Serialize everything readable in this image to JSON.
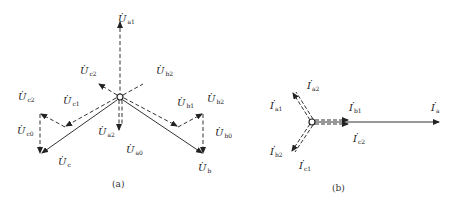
{
  "diagram_a": {
    "caption": "(a)",
    "labels": {
      "Ua1": {
        "sym": "U",
        "sub": "a1"
      },
      "Ua2": {
        "sym": "U",
        "sub": "a2"
      },
      "Ua0": {
        "sym": "U",
        "sub": "a0"
      },
      "Ub": {
        "sym": "U",
        "sub": "b"
      },
      "Ub1": {
        "sym": "U",
        "sub": "b1"
      },
      "Ub2_top": {
        "sym": "U",
        "sub": "b2"
      },
      "Ub2": {
        "sym": "U",
        "sub": "b2"
      },
      "Ub0": {
        "sym": "U",
        "sub": "b0"
      },
      "Uc": {
        "sym": "U",
        "sub": "c"
      },
      "Uc1": {
        "sym": "U",
        "sub": "c1"
      },
      "Uc2_top": {
        "sym": "U",
        "sub": "c2"
      },
      "Uc2": {
        "sym": "U",
        "sub": "c2"
      },
      "Uc0": {
        "sym": "U",
        "sub": "c0"
      }
    }
  },
  "diagram_b": {
    "caption": "(b)",
    "labels": {
      "Ia": {
        "sym": "I",
        "sub": "a"
      },
      "Ia1": {
        "sym": "I",
        "sub": "a1"
      },
      "Ia2": {
        "sym": "I",
        "sub": "a2"
      },
      "Ib1": {
        "sym": "I",
        "sub": "b1"
      },
      "Ib2": {
        "sym": "I",
        "sub": "b2"
      },
      "Ic1": {
        "sym": "I",
        "sub": "c1"
      },
      "Ic2": {
        "sym": "I",
        "sub": "c2"
      }
    }
  },
  "dot_char": "·"
}
